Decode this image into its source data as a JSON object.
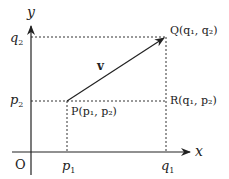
{
  "diagram": {
    "axes": {
      "x_label": "x",
      "y_label": "y",
      "origin_label": "O"
    },
    "ticks": {
      "x": [
        {
          "label": "p",
          "sub": "1",
          "x": 67
        },
        {
          "label": "q",
          "sub": "1",
          "x": 166
        }
      ],
      "y": [
        {
          "label": "q",
          "sub": "2",
          "y": 37
        },
        {
          "label": "p",
          "sub": "2",
          "y": 101
        }
      ]
    },
    "points": {
      "P": {
        "name": "P",
        "label": "P(p₁, p₂)",
        "x": 67,
        "y": 101
      },
      "Q": {
        "name": "Q",
        "label": "Q(q₁, q₂)",
        "x": 166,
        "y": 37
      },
      "R": {
        "name": "R",
        "label": "R(q₁, p₂)",
        "x": 166,
        "y": 101
      }
    },
    "vector": {
      "label": "v",
      "from": "P",
      "to": "Q"
    },
    "colors": {
      "line": "#222222",
      "dotted": "#333333",
      "background": "#ffffff"
    }
  }
}
